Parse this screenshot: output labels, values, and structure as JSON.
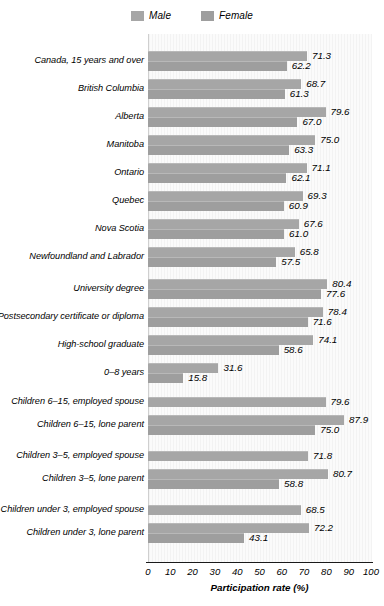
{
  "legend": {
    "entries": [
      {
        "label": "Male",
        "color": "#a6a6a6",
        "icon": "legend-swatch-male"
      },
      {
        "label": "Female",
        "color": "#9e9e9e",
        "icon": "legend-swatch-female"
      }
    ]
  },
  "axis": {
    "xlabel": "Participation rate (%)",
    "ticks": [
      "0",
      "10",
      "20",
      "30",
      "40",
      "50",
      "60",
      "70",
      "80",
      "90",
      "100"
    ]
  },
  "chart_data": {
    "type": "bar",
    "orientation": "horizontal",
    "title": "",
    "xlabel": "Participation rate (%)",
    "ylabel": "",
    "xlim": [
      0,
      100
    ],
    "xticks": [
      0,
      10,
      20,
      30,
      40,
      50,
      60,
      70,
      80,
      90,
      100
    ],
    "grid": false,
    "legend": [
      "Male",
      "Female"
    ],
    "legend_position": "top-center",
    "categories": [
      "Canada, 15 years and over",
      "British Columbia",
      "Alberta",
      "Manitoba",
      "Ontario",
      "Quebec",
      "Nova Scotia",
      "Newfoundland and Labrador",
      "University degree",
      "Postsecondary certificate or diploma",
      "High-school graduate",
      "0–8 years",
      "Children 6–15, employed spouse",
      "Children 6–15, lone parent",
      "Children 3–5, employed spouse",
      "Children 3–5, lone parent",
      "Children under 3, employed spouse",
      "Children under 3, lone parent"
    ],
    "series": [
      {
        "name": "Male",
        "values": [
          71.3,
          68.7,
          79.6,
          75.0,
          71.1,
          69.3,
          67.6,
          65.8,
          80.4,
          78.4,
          74.1,
          31.6,
          79.6,
          87.9,
          71.8,
          80.7,
          68.5,
          72.2
        ]
      },
      {
        "name": "Female",
        "values": [
          62.2,
          61.3,
          67.0,
          63.3,
          62.1,
          60.9,
          61.0,
          57.5,
          77.6,
          71.6,
          58.6,
          15.8,
          null,
          75.0,
          null,
          58.8,
          null,
          43.1
        ]
      }
    ]
  },
  "rows": [
    {
      "label": "Canada, 15 years and over",
      "male": "71.3",
      "female": "62.2",
      "male_val": 71.3,
      "female_val": 62.2,
      "y": 50,
      "gap_before": 0
    },
    {
      "label": "British Columbia",
      "male": "68.7",
      "female": "61.3",
      "male_val": 68.7,
      "female_val": 61.3,
      "y": 78,
      "gap_before": 0
    },
    {
      "label": "Alberta",
      "male": "79.6",
      "female": "67.0",
      "male_val": 79.6,
      "female_val": 67.0,
      "y": 106,
      "gap_before": 0
    },
    {
      "label": "Manitoba",
      "male": "75.0",
      "female": "63.3",
      "male_val": 75.0,
      "female_val": 63.3,
      "y": 134,
      "gap_before": 0
    },
    {
      "label": "Ontario",
      "male": "71.1",
      "female": "62.1",
      "male_val": 71.1,
      "female_val": 62.1,
      "y": 162,
      "gap_before": 0
    },
    {
      "label": "Quebec",
      "male": "69.3",
      "female": "60.9",
      "male_val": 69.3,
      "female_val": 60.9,
      "y": 190,
      "gap_before": 0
    },
    {
      "label": "Nova Scotia",
      "male": "67.6",
      "female": "61.0",
      "male_val": 67.6,
      "female_val": 61.0,
      "y": 218,
      "gap_before": 0
    },
    {
      "label": "Newfoundland and Labrador",
      "male": "65.8",
      "female": "57.5",
      "male_val": 65.8,
      "female_val": 57.5,
      "y": 246,
      "gap_before": 0
    },
    {
      "label": "University degree",
      "male": "80.4",
      "female": "77.6",
      "male_val": 80.4,
      "female_val": 77.6,
      "y": 278,
      "gap_before": 1
    },
    {
      "label": "Postsecondary certificate or diploma",
      "male": "78.4",
      "female": "71.6",
      "male_val": 78.4,
      "female_val": 71.6,
      "y": 306,
      "gap_before": 0
    },
    {
      "label": "High-school graduate",
      "male": "74.1",
      "female": "58.6",
      "male_val": 74.1,
      "female_val": 58.6,
      "y": 334,
      "gap_before": 0
    },
    {
      "label": "0–8 years",
      "male": "31.6",
      "female": "15.8",
      "male_val": 31.6,
      "female_val": 15.8,
      "y": 362,
      "gap_before": 0
    },
    {
      "label": "Children 6–15, employed spouse",
      "male": "79.6",
      "female": null,
      "male_val": 79.6,
      "female_val": null,
      "y": 396,
      "gap_before": 1
    },
    {
      "label": "Children 6–15, lone parent",
      "male": "87.9",
      "female": "75.0",
      "male_val": 87.9,
      "female_val": 75.0,
      "y": 414,
      "gap_before": 0
    },
    {
      "label": "Children 3–5, employed spouse",
      "male": "71.8",
      "female": null,
      "male_val": 71.8,
      "female_val": null,
      "y": 450,
      "gap_before": 1
    },
    {
      "label": "Children 3–5, lone parent",
      "male": "80.7",
      "female": "58.8",
      "male_val": 80.7,
      "female_val": 58.8,
      "y": 468,
      "gap_before": 0
    },
    {
      "label": "Children under 3, employed spouse",
      "male": "68.5",
      "female": null,
      "male_val": 68.5,
      "female_val": null,
      "y": 504,
      "gap_before": 1
    },
    {
      "label": "Children under 3, lone parent",
      "male": "72.2",
      "female": "43.1",
      "male_val": 72.2,
      "female_val": 43.1,
      "y": 522,
      "gap_before": 0
    }
  ]
}
